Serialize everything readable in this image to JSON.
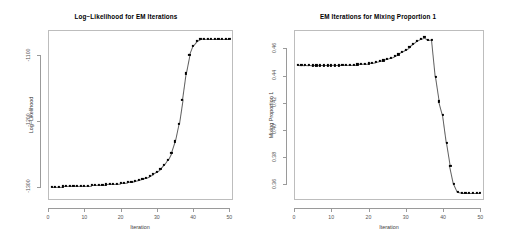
{
  "figure": {
    "background": "#ffffff",
    "point_color": "#000000",
    "line_color": "#606060",
    "frame_color": "#bdbdbd"
  },
  "panels": [
    {
      "name": "log-likelihood-panel",
      "chart_data": {
        "type": "scatter",
        "title": "Log−Likelihood for EM Iterations",
        "xlabel": "Iteration",
        "ylabel": "Log−Likelihood",
        "grid": false,
        "legend": "none",
        "xlim": [
          0,
          51
        ],
        "ylim": [
          -1320,
          -1062
        ],
        "xticks": [
          0,
          10,
          20,
          30,
          40,
          50
        ],
        "xtick_labels": [
          "0",
          "10",
          "20",
          "30",
          "40",
          "50"
        ],
        "yticks": [
          -1100,
          -1200,
          -1300
        ],
        "ytick_labels": [
          "-1100",
          "-1200",
          "-1300"
        ],
        "x": [
          1,
          2,
          3,
          4,
          5,
          6,
          7,
          8,
          9,
          10,
          11,
          12,
          13,
          14,
          15,
          16,
          17,
          18,
          19,
          20,
          21,
          22,
          23,
          24,
          25,
          26,
          27,
          28,
          29,
          30,
          31,
          32,
          33,
          34,
          35,
          36,
          37,
          38,
          39,
          40,
          41,
          42,
          43,
          44,
          45,
          46,
          47,
          48,
          49,
          50
        ],
        "y": [
          -1300.0,
          -1299.8,
          -1299.6,
          -1299.4,
          -1299.2,
          -1299.0,
          -1298.8,
          -1298.6,
          -1298.4,
          -1298.2,
          -1298.0,
          -1297.7,
          -1297.4,
          -1297.1,
          -1296.8,
          -1296.4,
          -1296.0,
          -1295.5,
          -1295.0,
          -1294.4,
          -1293.7,
          -1292.9,
          -1292.0,
          -1290.9,
          -1289.6,
          -1288.0,
          -1286.1,
          -1283.8,
          -1281.0,
          -1277.5,
          -1273.0,
          -1267.0,
          -1259.0,
          -1248.0,
          -1231.0,
          -1205.0,
          -1168.0,
          -1128.0,
          -1100.0,
          -1086.0,
          -1079.0,
          -1076.0,
          -1075.2,
          -1075.0,
          -1075.0,
          -1075.0,
          -1075.0,
          -1075.0,
          -1075.0,
          -1075.0
        ]
      }
    },
    {
      "name": "mixing-proportion-panel",
      "chart_data": {
        "type": "scatter",
        "title": "EM Iterations for Mixing Proportion 1",
        "xlabel": "Iteration",
        "ylabel": "Mixing Proportion 1",
        "grid": false,
        "legend": "none",
        "xlim": [
          0,
          51
        ],
        "ylim": [
          0.3485,
          0.4735
        ],
        "xticks": [
          0,
          10,
          20,
          30,
          40,
          50
        ],
        "xtick_labels": [
          "0",
          "10",
          "20",
          "30",
          "40",
          "50"
        ],
        "yticks": [
          0.46,
          0.44,
          0.42,
          0.4,
          0.38,
          0.36
        ],
        "ytick_labels": [
          "0.46",
          "0.44",
          "0.42",
          "0.40",
          "0.38",
          "0.36"
        ],
        "x": [
          1,
          2,
          3,
          4,
          5,
          6,
          7,
          8,
          9,
          10,
          11,
          12,
          13,
          14,
          15,
          16,
          17,
          18,
          19,
          20,
          21,
          22,
          23,
          24,
          25,
          26,
          27,
          28,
          29,
          30,
          31,
          32,
          33,
          34,
          35,
          36,
          37,
          38,
          39,
          40,
          41,
          42,
          43,
          44,
          45,
          46,
          47,
          48,
          49,
          50
        ],
        "y": [
          0.448,
          0.4478,
          0.4477,
          0.4476,
          0.4475,
          0.4475,
          0.4474,
          0.4474,
          0.4474,
          0.4474,
          0.4475,
          0.4475,
          0.4476,
          0.4477,
          0.4478,
          0.448,
          0.4482,
          0.4484,
          0.4487,
          0.449,
          0.4494,
          0.4499,
          0.4505,
          0.4512,
          0.452,
          0.453,
          0.4542,
          0.4556,
          0.4572,
          0.459,
          0.461,
          0.4632,
          0.4655,
          0.4672,
          0.4682,
          0.4662,
          0.4665,
          0.4392,
          0.421,
          0.4108,
          0.3905,
          0.3735,
          0.3605,
          0.3545,
          0.354,
          0.354,
          0.354,
          0.354,
          0.354,
          0.354
        ]
      }
    }
  ]
}
